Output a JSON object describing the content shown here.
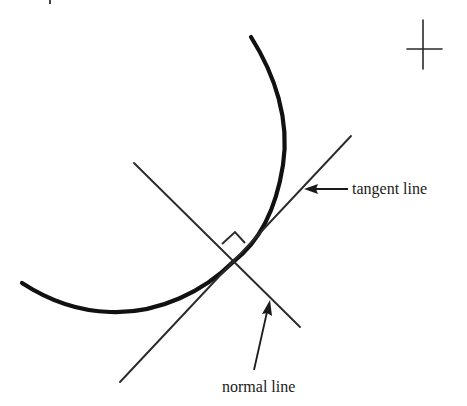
{
  "figure": {
    "type": "geometry-diagram",
    "labels": {
      "tangent": "tangent line",
      "normal": "normal line"
    },
    "colors": {
      "background": "#ffffff",
      "ink": "#111111"
    },
    "elements": {
      "curve": {
        "stroke_width": 4.2
      },
      "tangent_line": {
        "from": [
          120,
          382
        ],
        "to": [
          351,
          136
        ]
      },
      "normal_line": {
        "from": [
          134,
          163
        ],
        "to": [
          300,
          327
        ]
      },
      "point_of_tangency": [
        233,
        262
      ],
      "right_angle_marker": true,
      "crosshair": {
        "center": [
          423,
          49
        ]
      }
    }
  }
}
